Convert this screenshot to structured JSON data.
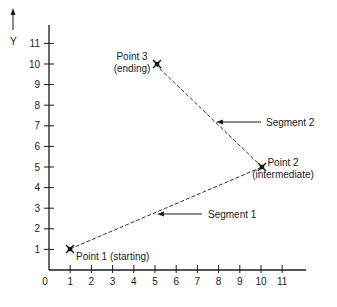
{
  "chart_data": {
    "type": "line",
    "title": "",
    "xlabel": "",
    "ylabel": "Y",
    "x_ticks": [
      "0",
      "1",
      "2",
      "3",
      "4",
      "5",
      "6",
      "7",
      "8",
      "9",
      "10",
      "11"
    ],
    "y_ticks": [
      "1",
      "2",
      "3",
      "4",
      "5",
      "6",
      "7",
      "8",
      "9",
      "10",
      "11"
    ],
    "xlim": [
      0,
      12
    ],
    "ylim": [
      0,
      12
    ],
    "grid": false,
    "points": [
      {
        "name": "Point 1",
        "role": "(starting)",
        "x": 1,
        "y": 1
      },
      {
        "name": "Point 2",
        "role": "(intermediate)",
        "x": 10,
        "y": 5
      },
      {
        "name": "Point 3",
        "role": "(ending)",
        "x": 5,
        "y": 10
      }
    ],
    "segments": [
      {
        "name": "Segment 1",
        "from": "Point 1",
        "to": "Point 2",
        "style": "dashed"
      },
      {
        "name": "Segment 2",
        "from": "Point 2",
        "to": "Point 3",
        "style": "dashed"
      }
    ]
  },
  "labels": {
    "y_axis": "Y",
    "p1": "Point 1 (starting)",
    "p2_name": "Point 2",
    "p2_role": "(intermediate)",
    "p3_name": "Point 3",
    "p3_role": "(ending)",
    "seg1": "Segment 1",
    "seg2": "Segment 2"
  }
}
